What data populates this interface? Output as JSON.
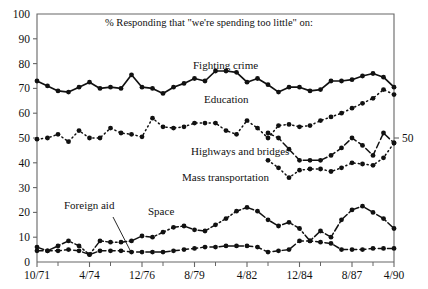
{
  "chart_data": {
    "type": "line",
    "title": "% Responding that \"we're spending too little\" on:",
    "xlabel": "",
    "ylabel": "",
    "ylim": [
      0,
      100
    ],
    "ytick_values": [
      0,
      10,
      20,
      30,
      40,
      50,
      60,
      70,
      80,
      90,
      100
    ],
    "ytick_labels": [
      "0",
      "10",
      "20",
      "30",
      "40",
      "50",
      "60",
      "70",
      "80",
      "90",
      "100"
    ],
    "xtick_labels": [
      "10/71",
      "4/74",
      "12/76",
      "8/79",
      "4/82",
      "12/84",
      "8/87",
      "4/90"
    ],
    "xtick_index": [
      0,
      5,
      10,
      15,
      20,
      25,
      30,
      34
    ],
    "right_axis_label": "50",
    "grid": false,
    "legend": "inline-labels",
    "series": [
      {
        "name": "Fighting crime",
        "label_x": 193,
        "label_y": 69,
        "style": "solid",
        "x_start": 0,
        "values": [
          73,
          71,
          69,
          68.5,
          70.5,
          72.5,
          70,
          70.5,
          70,
          75.5,
          70.5,
          70,
          68,
          70.5,
          72,
          74,
          73,
          77,
          77,
          76.5,
          72.5,
          74,
          71.5,
          68.5,
          70.5,
          70.5,
          69,
          69.5,
          73,
          73,
          73.5,
          75,
          76,
          74.5,
          70.5
        ]
      },
      {
        "name": "Education",
        "label_x": 204,
        "label_y": 103,
        "style": "dotted",
        "x_start": 0,
        "values": [
          49.5,
          50,
          51.5,
          48.5,
          53,
          50,
          50,
          54,
          52,
          51.5,
          50.5,
          58,
          54.5,
          54,
          54.5,
          56,
          56,
          56,
          53,
          51.5,
          57,
          54,
          50,
          55,
          55.5,
          54.5,
          55,
          57,
          58.5,
          60,
          62,
          64,
          66,
          69.5,
          67.5
        ]
      },
      {
        "name": "Highways and bridges",
        "label_x": 191,
        "label_y": 155,
        "style": "dashed",
        "x_start": 22,
        "values": [
          52,
          50,
          45.5,
          41,
          41,
          41,
          43,
          46,
          50,
          47,
          43,
          52,
          48
        ]
      },
      {
        "name": "Mass transportation",
        "label_x": 182,
        "label_y": 181,
        "style": "dotted",
        "x_start": 22,
        "values": [
          41,
          38,
          34,
          37,
          37.5,
          37.5,
          36.5,
          38,
          40,
          39.5,
          39,
          42,
          48
        ]
      },
      {
        "name": "Space",
        "label_x": 148,
        "label_y": 215,
        "style": "dash-dot",
        "x_start": 0,
        "values": [
          6,
          4.5,
          6.5,
          8.5,
          6.5,
          3,
          8.5,
          8,
          8,
          8.5,
          10.5,
          10,
          12,
          14,
          14.5,
          13,
          12.5,
          15,
          17.5,
          20.5,
          22,
          20.5,
          17,
          14.5,
          16,
          13.5,
          8.5,
          12.5,
          10,
          17,
          21,
          22.5,
          20,
          17.5,
          13.5
        ]
      },
      {
        "name": "Foreign aid",
        "label_x": 64,
        "label_y": 209,
        "leader": {
          "x1": 113,
          "y1": 217,
          "x2": 132,
          "y2": 254
        },
        "style": "dashed",
        "x_start": 0,
        "values": [
          4.5,
          4.5,
          4.5,
          5,
          4.5,
          3,
          4.5,
          4.5,
          4.5,
          4,
          4,
          4,
          4,
          4.5,
          5,
          5.5,
          6,
          6,
          6.5,
          6.5,
          6.5,
          6,
          4,
          4.5,
          5,
          8.5,
          8.5,
          8,
          7.5,
          5,
          5,
          5,
          5.5,
          5.5,
          5.5
        ]
      }
    ]
  },
  "colors": {
    "ink": "#111111",
    "axis": "#444444"
  }
}
